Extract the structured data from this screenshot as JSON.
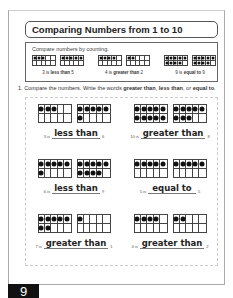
{
  "title": "Comparing Numbers from 1 to 10",
  "example": {
    "intro": "Compare numbers by counting.",
    "items": [
      {
        "left": 3,
        "right": 5,
        "num_a": "3",
        "word_is": " is ",
        "relation": "less than",
        "num_b": " 5"
      },
      {
        "left": 4,
        "right": 2,
        "num_a": "4",
        "word_is": " is ",
        "relation": "greater than",
        "num_b": " 2"
      },
      {
        "left": 9,
        "right": 9,
        "num_a": "9",
        "word_is": " is ",
        "relation": "equal to",
        "num_b": " 9"
      }
    ]
  },
  "instruction": {
    "prefix": "1. Compare the numbers. Write the words ",
    "w1": "greater than",
    "sep1": ", ",
    "w2": "less than",
    "sep2": ", or ",
    "w3": "equal to",
    "suffix": "."
  },
  "problems": [
    {
      "left": 3,
      "right": 6,
      "a": "3 is",
      "answer": "less than",
      "b": "6"
    },
    {
      "left": 10,
      "right": 8,
      "a": "10 is",
      "answer": "greater than",
      "b": "8"
    },
    {
      "left": 6,
      "right": 9,
      "a": "6 is",
      "answer": "less than",
      "b": "9"
    },
    {
      "left": 5,
      "right": 5,
      "a": "5 is",
      "answer": "equal to",
      "b": "5"
    },
    {
      "left": 7,
      "right": 1,
      "a": "7 is",
      "answer": "greater than",
      "b": "1"
    },
    {
      "left": 4,
      "right": 2,
      "a": "4 is",
      "answer": "greater than",
      "b": "2"
    }
  ],
  "page_number": "9"
}
